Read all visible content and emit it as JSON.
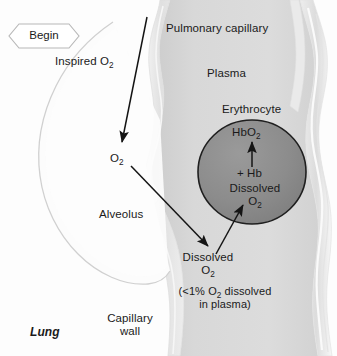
{
  "figure": {
    "start_node": {
      "label": "Begin"
    },
    "colors": {
      "background": "#fdfdfd",
      "plasma_fill": "#d9d9d9",
      "capillary_wall": "#e8e8e8",
      "erythrocyte_fill": "#8d8d8d",
      "erythrocyte_stroke": "#1f1f1f",
      "alveolus_stroke": "#d2d2d2",
      "alveolus_fill": "#fcfcfc",
      "arrow": "#151515",
      "text": "#1a1a1a"
    },
    "regions": {
      "lung": "Lung",
      "alveolus": "Alveolus",
      "capillary_wall": "Capillary wall",
      "pulmonary_capillary": "Pulmonary capillary",
      "plasma": "Plasma",
      "erythrocyte": "Erythrocyte"
    },
    "labels": {
      "inspired_o2": "Inspired O",
      "inspired_o2_sub": "2",
      "o2_alveolus": "O",
      "o2_alveolus_sub": "2",
      "dissolved_plasma_line1": "Dissolved",
      "dissolved_plasma_line2": "O",
      "dissolved_plasma_line2_sub": "2",
      "dissolved_rbc_line1": "Dissolved",
      "dissolved_rbc_line2": "O",
      "dissolved_rbc_line2_sub": "2",
      "hbo2": "HbO",
      "hbo2_sub": "2",
      "plus_hb": "+ Hb",
      "note_plasma": "(<1% O2 dissolved in plasma)"
    },
    "arrows": [
      {
        "name": "inspired-o2-to-alveolar-o2",
        "from": "Inspired O2",
        "to": "O2 (alveolus)"
      },
      {
        "name": "alveolar-o2-to-dissolved-plasma",
        "from": "O2 (alveolus)",
        "to": "Dissolved O2 (plasma)"
      },
      {
        "name": "dissolved-plasma-to-erythrocyte",
        "from": "Dissolved O2 (plasma)",
        "to": "Dissolved O2 (erythrocyte)"
      },
      {
        "name": "dissolved-o2-plus-hb-to-hbo2",
        "from": "Dissolved O2 + Hb",
        "to": "HbO2"
      }
    ]
  }
}
